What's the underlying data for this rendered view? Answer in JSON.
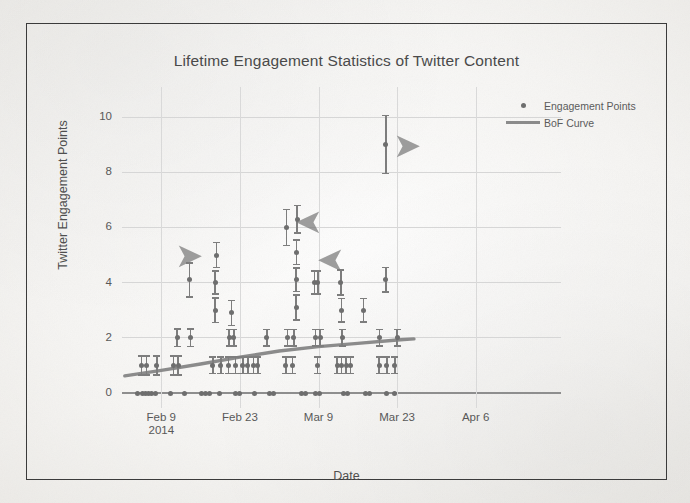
{
  "figure": {
    "background_color": "#f5f4f2",
    "frame_color": "#3b3b3b",
    "marker_color": "#6e6e6e",
    "errorbar_color": "#7d7d7d",
    "curve_color": "#8b8b8b",
    "arrow_color": "#7a7a7a",
    "grid_color": "#d6d6d6"
  },
  "legend": {
    "position": "top-right",
    "entries": [
      {
        "label": "Engagement Points",
        "marker": "dot-marker-icon"
      },
      {
        "label": "BoF Curve",
        "marker": "line-marker-icon"
      }
    ]
  },
  "annotations": [
    {
      "name": "arrow-annotation-1",
      "icon": "arrow-right-icon",
      "direction": "right",
      "glyph": "➤",
      "x_px": 196,
      "y_px": 254
    },
    {
      "name": "arrow-annotation-2",
      "icon": "arrow-left-icon",
      "direction": "left",
      "glyph": "➤",
      "x_px": 316,
      "y_px": 220
    },
    {
      "name": "arrow-annotation-3",
      "icon": "arrow-left-icon",
      "direction": "left",
      "glyph": "➤",
      "x_px": 338,
      "y_px": 258
    },
    {
      "name": "arrow-annotation-4",
      "icon": "arrow-right-icon",
      "direction": "right",
      "glyph": "➤",
      "x_px": 414,
      "y_px": 144
    }
  ],
  "chart_data": {
    "type": "scatter",
    "title": "Lifetime Engagement Statistics of Twitter Content",
    "xlabel": "Date",
    "ylabel": "Twitter Engagement Points",
    "grid": true,
    "legend_position": "top-right",
    "yticks": [
      0,
      2,
      4,
      6,
      8,
      10
    ],
    "ylim": [
      0,
      10.6
    ],
    "xticks": [
      "Feb 9\n2014",
      "Feb 23",
      "Mar 9",
      "Mar 23",
      "Apr 6"
    ],
    "xtick_labels": [
      {
        "line1": "Feb 9",
        "line2": "2014"
      },
      {
        "line1": "Feb 23",
        "line2": ""
      },
      {
        "line1": "Mar 9",
        "line2": ""
      },
      {
        "line1": "Mar 23",
        "line2": ""
      },
      {
        "line1": "Apr 6",
        "line2": ""
      }
    ],
    "xlim_days": [
      -7,
      63
    ],
    "series": [
      {
        "name": "Engagement Points",
        "type": "scatter-errorbar",
        "points": [
          {
            "x": -3.5,
            "y": 1.0,
            "err": 0.35
          },
          {
            "x": -2.6,
            "y": 1.0,
            "err": 0.35
          },
          {
            "x": -0.8,
            "y": 1.0,
            "err": 0.35
          },
          {
            "x": 2.8,
            "y": 2.0,
            "err": 0.32
          },
          {
            "x": 5.2,
            "y": 2.0,
            "err": 0.32
          },
          {
            "x": 2.2,
            "y": 1.0,
            "err": 0.35
          },
          {
            "x": 3.0,
            "y": 1.0,
            "err": 0.35
          },
          {
            "x": 5.0,
            "y": 4.1,
            "err": 0.62
          },
          {
            "x": 9.6,
            "y": 3.0,
            "err": 0.45
          },
          {
            "x": 9.6,
            "y": 4.0,
            "err": 0.42
          },
          {
            "x": 9.8,
            "y": 5.0,
            "err": 0.45
          },
          {
            "x": 9.2,
            "y": 1.0,
            "err": 0.3
          },
          {
            "x": 10.6,
            "y": 1.0,
            "err": 0.3
          },
          {
            "x": 12.1,
            "y": 2.0,
            "err": 0.3
          },
          {
            "x": 12.9,
            "y": 2.0,
            "err": 0.3
          },
          {
            "x": 12.5,
            "y": 2.9,
            "err": 0.45
          },
          {
            "x": 12.0,
            "y": 1.0,
            "err": 0.3
          },
          {
            "x": 13.2,
            "y": 1.0,
            "err": 0.3
          },
          {
            "x": 14.5,
            "y": 1.0,
            "err": 0.3
          },
          {
            "x": 15.4,
            "y": 1.0,
            "err": 0.3
          },
          {
            "x": 16.4,
            "y": 1.0,
            "err": 0.3
          },
          {
            "x": 17.2,
            "y": 1.0,
            "err": 0.3
          },
          {
            "x": 18.8,
            "y": 2.0,
            "err": 0.3
          },
          {
            "x": 22.3,
            "y": 6.0,
            "err": 0.65
          },
          {
            "x": 22.5,
            "y": 2.0,
            "err": 0.3
          },
          {
            "x": 23.6,
            "y": 2.0,
            "err": 0.3
          },
          {
            "x": 22.2,
            "y": 1.0,
            "err": 0.3
          },
          {
            "x": 23.4,
            "y": 1.0,
            "err": 0.3
          },
          {
            "x": 24.0,
            "y": 3.1,
            "err": 0.45
          },
          {
            "x": 24.0,
            "y": 4.1,
            "err": 0.42
          },
          {
            "x": 24.1,
            "y": 5.1,
            "err": 0.45
          },
          {
            "x": 24.2,
            "y": 6.3,
            "err": 0.5
          },
          {
            "x": 27.3,
            "y": 4.0,
            "err": 0.42
          },
          {
            "x": 27.9,
            "y": 4.0,
            "err": 0.42
          },
          {
            "x": 27.5,
            "y": 2.0,
            "err": 0.3
          },
          {
            "x": 28.3,
            "y": 2.0,
            "err": 0.3
          },
          {
            "x": 27.8,
            "y": 1.0,
            "err": 0.3
          },
          {
            "x": 32.0,
            "y": 4.0,
            "err": 0.45
          },
          {
            "x": 32.1,
            "y": 3.0,
            "err": 0.42
          },
          {
            "x": 32.2,
            "y": 2.0,
            "err": 0.3
          },
          {
            "x": 31.3,
            "y": 1.0,
            "err": 0.3
          },
          {
            "x": 32.1,
            "y": 1.0,
            "err": 0.3
          },
          {
            "x": 32.9,
            "y": 1.0,
            "err": 0.3
          },
          {
            "x": 33.7,
            "y": 1.0,
            "err": 0.3
          },
          {
            "x": 36.0,
            "y": 3.0,
            "err": 0.42
          },
          {
            "x": 40.0,
            "y": 9.0,
            "err": 1.05
          },
          {
            "x": 40.0,
            "y": 4.1,
            "err": 0.45
          },
          {
            "x": 38.9,
            "y": 2.0,
            "err": 0.3
          },
          {
            "x": 42.0,
            "y": 2.0,
            "err": 0.3
          },
          {
            "x": 38.8,
            "y": 1.0,
            "err": 0.3
          },
          {
            "x": 40.2,
            "y": 1.0,
            "err": 0.3
          },
          {
            "x": 41.6,
            "y": 1.0,
            "err": 0.3
          },
          {
            "x": -4.2,
            "y": 0
          },
          {
            "x": -3.4,
            "y": 0
          },
          {
            "x": -2.9,
            "y": 0
          },
          {
            "x": -2.3,
            "y": 0
          },
          {
            "x": -1.7,
            "y": 0
          },
          {
            "x": -1.0,
            "y": 0
          },
          {
            "x": 1.6,
            "y": 0
          },
          {
            "x": 4.2,
            "y": 0
          },
          {
            "x": 7.2,
            "y": 0
          },
          {
            "x": 7.9,
            "y": 0
          },
          {
            "x": 8.6,
            "y": 0
          },
          {
            "x": 10.4,
            "y": 0
          },
          {
            "x": 13.2,
            "y": 0
          },
          {
            "x": 14.0,
            "y": 0
          },
          {
            "x": 16.6,
            "y": 0
          },
          {
            "x": 19.2,
            "y": 0
          },
          {
            "x": 19.9,
            "y": 0
          },
          {
            "x": 25.0,
            "y": 0
          },
          {
            "x": 25.7,
            "y": 0
          },
          {
            "x": 27.5,
            "y": 0
          },
          {
            "x": 28.2,
            "y": 0
          },
          {
            "x": 32.4,
            "y": 0
          },
          {
            "x": 33.1,
            "y": 0
          },
          {
            "x": 36.4,
            "y": 0
          },
          {
            "x": 37.1,
            "y": 0
          },
          {
            "x": 40.2,
            "y": 0
          },
          {
            "x": 41.6,
            "y": 0
          }
        ]
      },
      {
        "name": "BoF Curve",
        "type": "line",
        "x": [
          -6.5,
          0,
          7,
          14,
          21,
          28,
          35,
          42,
          45
        ],
        "y": [
          0.62,
          0.82,
          1.05,
          1.3,
          1.52,
          1.68,
          1.8,
          1.92,
          1.96
        ]
      }
    ]
  }
}
